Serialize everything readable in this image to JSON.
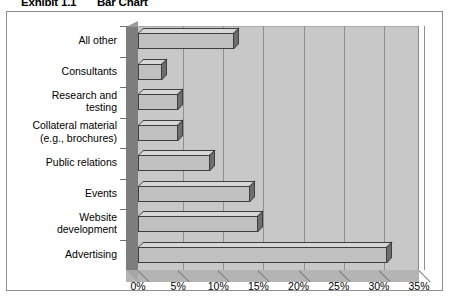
{
  "exhibit": {
    "label": "Exhibit 1.1",
    "title": "Bar Chart"
  },
  "chart_data": {
    "type": "bar",
    "orientation": "horizontal",
    "title": "Bar Chart",
    "subtitle": "Exhibit 1.1",
    "xlabel": "",
    "ylabel": "",
    "categories": [
      "All other",
      "Consultants",
      "Research and\ntesting",
      "Collateral material\n(e.g., brochures)",
      "Public relations",
      "Events",
      "Website\ndevelopment",
      "Advertising"
    ],
    "values": [
      12,
      3,
      5,
      5,
      9,
      14,
      15,
      31
    ],
    "value_unit": "%",
    "xlim": [
      0,
      35
    ],
    "xticks": [
      0,
      5,
      10,
      15,
      20,
      25,
      30,
      35
    ],
    "xtick_labels": [
      "0%",
      "5%",
      "10%",
      "15%",
      "20%",
      "25%",
      "30%",
      "35%"
    ],
    "grid": true,
    "grid_axis": "x",
    "legend": false,
    "style": "3d",
    "colors": {
      "bar_face": "#c0c0c0",
      "bar_top": "#d6d6d6",
      "bar_side": "#6e6e6e",
      "bar_outline": "#3e3e3e",
      "plot_wall": "#c8c8c8",
      "left_wall": "#7d7d7d",
      "floor": "#b4b4b4",
      "gridline": "#8f8f8f",
      "frame_border": "#8e8e8e",
      "background": "#ffffff",
      "text": "#000000"
    }
  }
}
